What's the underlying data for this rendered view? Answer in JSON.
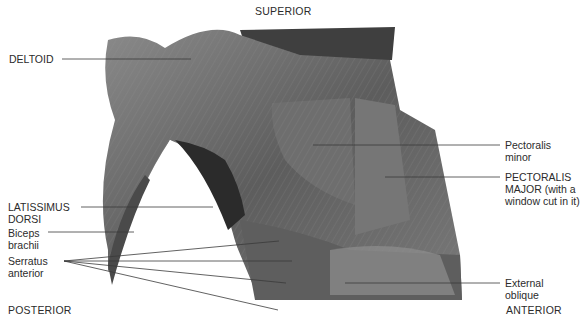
{
  "figure": {
    "orientation": {
      "superior": "SUPERIOR",
      "posterior": "POSTERIOR",
      "anterior": "ANTERIOR"
    },
    "labels": {
      "deltoid": "DELTOID",
      "latissimus_line1": "LATISSIMUS",
      "latissimus_line2": "DORSI",
      "biceps_line1": "Biceps",
      "biceps_line2": "brachii",
      "serratus_line1": "Serratus",
      "serratus_line2": "anterior",
      "pec_minor_line1": "Pectoralis",
      "pec_minor_line2": "minor",
      "pec_major_line1": "PECTORALIS",
      "pec_major_line2": "MAJOR (with a",
      "pec_major_line3": "window cut in it)",
      "ext_oblique_line1": "External",
      "ext_oblique_line2": "oblique"
    },
    "colors": {
      "background": "#ffffff",
      "leader_line": "#3a3a3a",
      "muscle_dark": "#3c3c3c",
      "muscle_mid": "#6e6e6e",
      "muscle_light": "#a5a5a5"
    }
  }
}
